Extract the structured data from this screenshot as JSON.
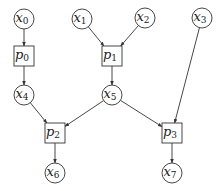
{
  "diagram": {
    "type": "directed-graph",
    "variable_nodes": [
      {
        "id": "x0",
        "base": "x",
        "sub": "0",
        "shape": "circle",
        "cx": 24,
        "cy": 19
      },
      {
        "id": "x1",
        "base": "x",
        "sub": "1",
        "shape": "circle",
        "cx": 82,
        "cy": 19
      },
      {
        "id": "x2",
        "base": "x",
        "sub": "2",
        "shape": "circle",
        "cx": 145,
        "cy": 18
      },
      {
        "id": "x3",
        "base": "x",
        "sub": "3",
        "shape": "circle",
        "cx": 202,
        "cy": 18
      },
      {
        "id": "x4",
        "base": "x",
        "sub": "4",
        "shape": "circle",
        "cx": 24,
        "cy": 95
      },
      {
        "id": "x5",
        "base": "x",
        "sub": "5",
        "shape": "circle",
        "cx": 112,
        "cy": 95
      },
      {
        "id": "x6",
        "base": "x",
        "sub": "6",
        "shape": "circle",
        "cx": 55,
        "cy": 173
      },
      {
        "id": "x7",
        "base": "x",
        "sub": "7",
        "shape": "circle",
        "cx": 172,
        "cy": 173
      }
    ],
    "process_nodes": [
      {
        "id": "p0",
        "base": "p",
        "sub": "0",
        "shape": "square",
        "cx": 24,
        "cy": 56
      },
      {
        "id": "p1",
        "base": "p",
        "sub": "1",
        "shape": "square",
        "cx": 112,
        "cy": 56
      },
      {
        "id": "p2",
        "base": "p",
        "sub": "2",
        "shape": "square",
        "cx": 55,
        "cy": 133
      },
      {
        "id": "p3",
        "base": "p",
        "sub": "3",
        "shape": "square",
        "cx": 172,
        "cy": 133
      }
    ],
    "edges": [
      {
        "from": "x0",
        "to": "p0"
      },
      {
        "from": "x1",
        "to": "p1"
      },
      {
        "from": "x2",
        "to": "p1"
      },
      {
        "from": "p0",
        "to": "x4"
      },
      {
        "from": "p1",
        "to": "x5"
      },
      {
        "from": "x3",
        "to": "p3"
      },
      {
        "from": "x4",
        "to": "p2"
      },
      {
        "from": "x5",
        "to": "p2"
      },
      {
        "from": "x5",
        "to": "p3"
      },
      {
        "from": "p2",
        "to": "x6"
      },
      {
        "from": "p3",
        "to": "x7"
      }
    ],
    "style": {
      "stroke": "#333333",
      "background": "#ffffff",
      "circle_radius": 10,
      "square_half": 10
    }
  }
}
